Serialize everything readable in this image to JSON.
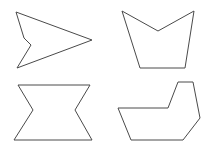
{
  "canvas": {
    "width": 210,
    "height": 149,
    "background_color": "#ffffff",
    "stroke_color": "#4a4a4a",
    "fill_color": "#ffffff",
    "stroke_width": 1
  },
  "shapes": [
    {
      "name": "arrowhead-polygon",
      "position": "top-left",
      "type": "concave-polygon",
      "vertex_count": 5,
      "points": "16,12 92,40 17,68 31,45 24,38",
      "description": "Arrowhead pointing right with a notch on the left side"
    },
    {
      "name": "notched-cup-polygon",
      "position": "top-right",
      "type": "concave-polygon",
      "vertex_count": 5,
      "points": "122,11 158,31 194,11 185,68 140,68",
      "description": "Cup or vase shape with a V notch cut into the top edge"
    },
    {
      "name": "hourglass-polygon",
      "position": "bottom-left",
      "type": "concave-polygon",
      "vertex_count": 6,
      "points": "18,85 90,85 75,110 92,140 14,140 33,110",
      "description": "Hourglass or bowtie shape pinched inward on both sides"
    },
    {
      "name": "boot-polygon",
      "position": "bottom-right",
      "type": "concave-polygon",
      "vertex_count": 7,
      "points": "178,82 193,82 200,118 183,140 131,140 118,108 168,108",
      "description": "Boot or L shape with a concave step on the upper left"
    }
  ]
}
